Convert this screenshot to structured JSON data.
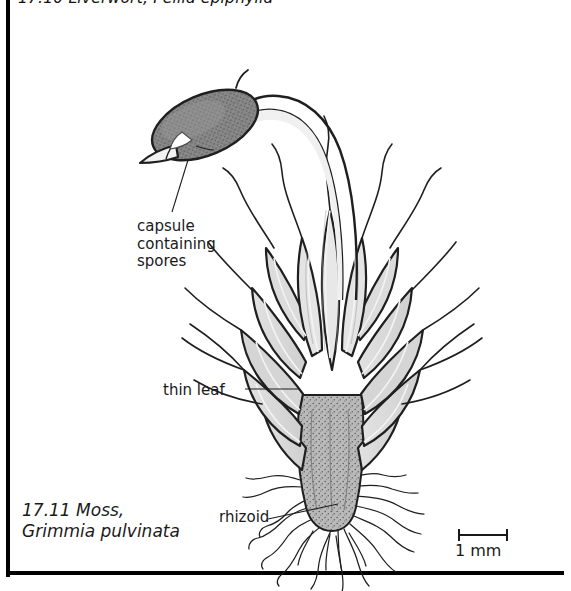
{
  "figure": {
    "previous_figure_caption": "17.10 Liverwort, Pellia epiphylla",
    "number": "17.11",
    "caption_line1": "17.11 Moss,",
    "caption_line2": "Grimmia pulvinata",
    "common_name": "Moss",
    "species_name": "Grimmia pulvinata"
  },
  "labels": {
    "capsule": "capsule\ncontaining\nspores",
    "capsule_line1": "capsule",
    "capsule_line2": "containing",
    "capsule_line3": "spores",
    "thin_leaf": "thin leaf",
    "rhizoid": "rhizoid"
  },
  "scale": {
    "value": "1 mm",
    "bar_length_px": 50
  },
  "colors": {
    "ink": "#1a1a1a",
    "frame": "#000000",
    "capsule_fill": "#808080",
    "leaf_fill": "#d8d8d8",
    "leaf_fill_dark": "#c2c2c2",
    "stem_fill": "#b5b5b5",
    "background": "#ffffff"
  },
  "structures": {
    "capsule": "capsule",
    "seta": "seta",
    "operculum": "operculum-beak",
    "leafy_shoot": "leafy-shoot",
    "rhizoids": "rhizoids",
    "hair_points": "leaf-hair-points"
  }
}
